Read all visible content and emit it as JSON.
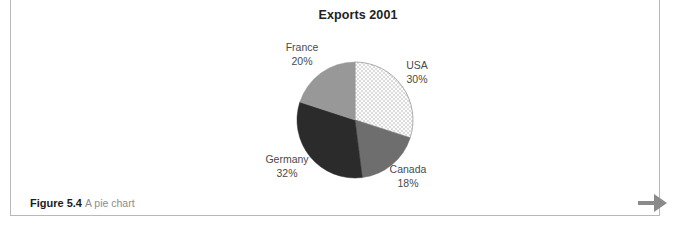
{
  "figure": {
    "caption_label": "Figure 5.4",
    "caption_text": "A pie chart"
  },
  "navigation": {
    "next_icon": "arrow-right-icon"
  },
  "chart_data": {
    "type": "pie",
    "title": "Exports 2001",
    "xlabel": "",
    "ylabel": "",
    "legend_position": "none",
    "grid": false,
    "labels_outside": true,
    "start_angle_deg": 0,
    "direction": "clockwise",
    "categories": [
      "USA",
      "Canada",
      "Germany",
      "France"
    ],
    "values": [
      30,
      18,
      32,
      20
    ],
    "units": "percent",
    "total": 100,
    "slices": [
      {
        "name": "USA",
        "value": 30,
        "label": "USA",
        "percent_label": "30%",
        "color": "#fbfbfb",
        "pattern": "fine-dot",
        "pattern_color": "#d0d0d0"
      },
      {
        "name": "Canada",
        "value": 18,
        "label": "Canada",
        "percent_label": "18%",
        "color": "#6e6e6e",
        "pattern": "solid",
        "pattern_color": "#6e6e6e"
      },
      {
        "name": "Germany",
        "value": 32,
        "label": "Germany",
        "percent_label": "32%",
        "color": "#2b2b2b",
        "pattern": "solid",
        "pattern_color": "#2b2b2b"
      },
      {
        "name": "France",
        "value": 20,
        "label": "France",
        "percent_label": "20%",
        "color": "#989898",
        "pattern": "solid",
        "pattern_color": "#989898"
      }
    ]
  }
}
